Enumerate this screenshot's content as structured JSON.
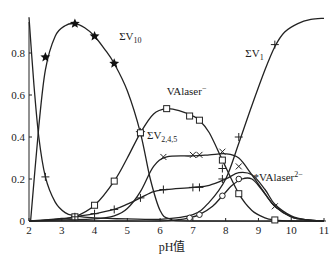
{
  "chart_data": {
    "type": "line",
    "title": "",
    "xlabel": "pH值",
    "ylabel": "",
    "xlim": [
      2,
      11
    ],
    "ylim": [
      0,
      1.0
    ],
    "grid": false,
    "legend": "inline labels",
    "x_ticks": [
      "2",
      "3",
      "4",
      "5",
      "6",
      "7",
      "8",
      "9",
      "10",
      "11"
    ],
    "y_ticks": [
      "0",
      "0.2",
      "0.4",
      "0.6",
      "0.8"
    ],
    "series": [
      {
        "name": "ΣV10",
        "label_main": "ΣV",
        "label_sub": "10",
        "marker": "star",
        "curve": [
          [
            2.05,
            0.0
          ],
          [
            2.3,
            0.45
          ],
          [
            2.5,
            0.72
          ],
          [
            2.8,
            0.88
          ],
          [
            3.1,
            0.93
          ],
          [
            3.4,
            0.94
          ],
          [
            3.7,
            0.92
          ],
          [
            4.0,
            0.88
          ],
          [
            4.3,
            0.82
          ],
          [
            4.6,
            0.75
          ],
          [
            5.0,
            0.62
          ],
          [
            5.4,
            0.42
          ],
          [
            5.7,
            0.2
          ],
          [
            6.0,
            0.05
          ],
          [
            6.3,
            0.01
          ],
          [
            7.0,
            0.0
          ],
          [
            11.0,
            0.0
          ]
        ],
        "markers": [
          [
            2.5,
            0.78
          ],
          [
            3.4,
            0.94
          ],
          [
            4.0,
            0.88
          ],
          [
            4.6,
            0.75
          ],
          [
            5.4,
            0.42
          ]
        ]
      },
      {
        "name": "ΣV1",
        "label_main": "ΣV",
        "label_sub": "1",
        "marker": "plus",
        "curve": [
          [
            2.0,
            0.97
          ],
          [
            2.15,
            0.65
          ],
          [
            2.3,
            0.4
          ],
          [
            2.5,
            0.21
          ],
          [
            2.8,
            0.09
          ],
          [
            3.1,
            0.04
          ],
          [
            3.4,
            0.025
          ],
          [
            4.0,
            0.015
          ],
          [
            5.0,
            0.01
          ],
          [
            6.0,
            0.008
          ],
          [
            7.0,
            0.03
          ],
          [
            7.5,
            0.09
          ],
          [
            8.0,
            0.2
          ],
          [
            8.4,
            0.37
          ],
          [
            8.8,
            0.55
          ],
          [
            9.2,
            0.72
          ],
          [
            9.5,
            0.83
          ],
          [
            9.8,
            0.9
          ],
          [
            10.2,
            0.94
          ],
          [
            10.6,
            0.96
          ],
          [
            11.0,
            0.965
          ]
        ],
        "markers": [
          [
            2.5,
            0.21
          ],
          [
            7.9,
            0.25
          ],
          [
            8.4,
            0.4
          ],
          [
            9.5,
            0.84
          ]
        ]
      },
      {
        "name": "VAlaser-",
        "label_main": "VAlaser",
        "label_sup": "−",
        "marker": "square",
        "curve": [
          [
            2.0,
            0.0
          ],
          [
            2.5,
            0.005
          ],
          [
            3.0,
            0.012
          ],
          [
            3.4,
            0.02
          ],
          [
            4.0,
            0.075
          ],
          [
            4.6,
            0.19
          ],
          [
            5.0,
            0.3
          ],
          [
            5.4,
            0.42
          ],
          [
            5.8,
            0.51
          ],
          [
            6.2,
            0.535
          ],
          [
            6.6,
            0.525
          ],
          [
            7.0,
            0.5
          ],
          [
            7.2,
            0.48
          ],
          [
            7.5,
            0.42
          ],
          [
            7.9,
            0.29
          ],
          [
            8.4,
            0.13
          ],
          [
            8.8,
            0.05
          ],
          [
            9.2,
            0.015
          ],
          [
            9.5,
            0.005
          ],
          [
            10.0,
            0.0
          ],
          [
            11.0,
            0.0
          ]
        ],
        "markers": [
          [
            3.4,
            0.02
          ],
          [
            4.0,
            0.075
          ],
          [
            4.6,
            0.19
          ],
          [
            5.4,
            0.42
          ],
          [
            6.2,
            0.535
          ],
          [
            6.9,
            0.5
          ],
          [
            7.2,
            0.48
          ],
          [
            7.9,
            0.29
          ],
          [
            8.4,
            0.13
          ],
          [
            9.5,
            0.005
          ]
        ]
      },
      {
        "name": "ΣV2,4,5",
        "label_main": "ΣV",
        "label_sub": "2,4,5",
        "marker": "cross",
        "curve": [
          [
            2.0,
            0.0
          ],
          [
            3.0,
            0.005
          ],
          [
            4.0,
            0.01
          ],
          [
            4.6,
            0.025
          ],
          [
            5.0,
            0.06
          ],
          [
            5.4,
            0.14
          ],
          [
            5.8,
            0.26
          ],
          [
            6.2,
            0.305
          ],
          [
            7.0,
            0.31
          ],
          [
            7.5,
            0.315
          ],
          [
            8.0,
            0.32
          ],
          [
            8.4,
            0.3
          ],
          [
            8.8,
            0.22
          ],
          [
            9.2,
            0.13
          ],
          [
            9.5,
            0.07
          ],
          [
            10.0,
            0.02
          ],
          [
            10.5,
            0.005
          ],
          [
            11.0,
            0.0
          ]
        ],
        "markers": [
          [
            6.1,
            0.305
          ],
          [
            7.0,
            0.315
          ],
          [
            7.2,
            0.315
          ],
          [
            7.9,
            0.33
          ],
          [
            8.4,
            0.26
          ],
          [
            9.5,
            0.07
          ]
        ]
      },
      {
        "name": "ΣV2,4,5 (+ series)",
        "label_main": "",
        "marker": "plus",
        "curve": [
          [
            2.0,
            0.0
          ],
          [
            3.0,
            0.01
          ],
          [
            3.4,
            0.02
          ],
          [
            4.0,
            0.035
          ],
          [
            4.6,
            0.055
          ],
          [
            5.0,
            0.08
          ],
          [
            5.4,
            0.11
          ],
          [
            5.8,
            0.14
          ],
          [
            6.2,
            0.15
          ],
          [
            7.0,
            0.16
          ],
          [
            7.5,
            0.17
          ],
          [
            8.0,
            0.2
          ],
          [
            8.4,
            0.23
          ],
          [
            8.8,
            0.22
          ],
          [
            9.2,
            0.15
          ],
          [
            9.5,
            0.08
          ],
          [
            10.0,
            0.025
          ],
          [
            10.5,
            0.005
          ],
          [
            11.0,
            0.0
          ]
        ],
        "markers": [
          [
            3.4,
            0.02
          ],
          [
            4.0,
            0.035
          ],
          [
            4.6,
            0.055
          ],
          [
            5.4,
            0.11
          ],
          [
            6.1,
            0.15
          ],
          [
            7.0,
            0.16
          ],
          [
            7.2,
            0.16
          ],
          [
            7.9,
            0.2
          ]
        ]
      },
      {
        "name": "*VAlaser2-",
        "label_main": "*VAlaser",
        "label_sup": "2−",
        "marker": "circle",
        "curve": [
          [
            2.0,
            0.0
          ],
          [
            5.0,
            0.0
          ],
          [
            6.0,
            0.0
          ],
          [
            6.5,
            0.005
          ],
          [
            6.9,
            0.015
          ],
          [
            7.2,
            0.03
          ],
          [
            7.6,
            0.07
          ],
          [
            7.9,
            0.12
          ],
          [
            8.2,
            0.17
          ],
          [
            8.5,
            0.2
          ],
          [
            8.8,
            0.2
          ],
          [
            9.1,
            0.15
          ],
          [
            9.5,
            0.07
          ],
          [
            10.0,
            0.02
          ],
          [
            10.5,
            0.005
          ],
          [
            11.0,
            0.0
          ]
        ],
        "markers": [
          [
            6.9,
            0.015
          ],
          [
            7.2,
            0.03
          ],
          [
            7.9,
            0.12
          ],
          [
            8.4,
            0.2
          ]
        ]
      }
    ],
    "annotations": [
      {
        "text_ref": "ΣV10",
        "x": 4.75,
        "y": 0.86
      },
      {
        "text_ref": "VAlaser-",
        "x": 6.2,
        "y": 0.6
      },
      {
        "text_ref": "ΣV2,4,5",
        "x": 5.6,
        "y": 0.39
      },
      {
        "text_ref": "ΣV1",
        "x": 8.6,
        "y": 0.78
      },
      {
        "text_ref": "*VAlaser2-",
        "x": 8.85,
        "y": 0.19
      }
    ]
  },
  "axes": {
    "x_title": "pH值"
  }
}
